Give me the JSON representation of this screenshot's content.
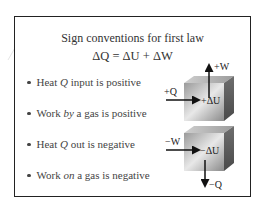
{
  "title": "Sign conventions for first law",
  "equation": "ΔQ = ΔU + ΔW",
  "bullets": [
    {
      "before": "Heat ",
      "emph": "Q",
      "after": " input is positive"
    },
    {
      "before": "Work ",
      "emph": "by",
      "after": " a gas is positive"
    },
    {
      "before": "Heat ",
      "emph": "Q",
      "after": " out is negative"
    },
    {
      "before": "Work ",
      "emph": "on",
      "after": " a gas is negative"
    }
  ],
  "diagram_top": {
    "heat_label": "+Q",
    "work_label": "+W",
    "energy_label": "+ΔU"
  },
  "diagram_bottom": {
    "work_label": "−W",
    "energy_label": "−ΔU",
    "heat_label": "−Q"
  }
}
